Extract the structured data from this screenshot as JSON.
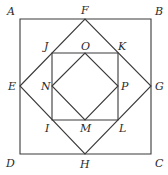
{
  "diagram": {
    "shapes": {
      "outer_square": [
        "A",
        "B",
        "C",
        "D"
      ],
      "outer_diamond": [
        "E",
        "F",
        "G",
        "H"
      ],
      "inner_square": [
        "J",
        "K",
        "L",
        "I"
      ],
      "inner_diamond": [
        "N",
        "O",
        "P",
        "M"
      ]
    },
    "points": {
      "A": {
        "x": 20,
        "y": 19
      },
      "B": {
        "x": 151,
        "y": 19
      },
      "C": {
        "x": 151,
        "y": 154
      },
      "D": {
        "x": 20,
        "y": 154
      },
      "E": {
        "x": 20,
        "y": 86
      },
      "F": {
        "x": 85,
        "y": 19
      },
      "G": {
        "x": 151,
        "y": 86
      },
      "H": {
        "x": 85,
        "y": 154
      },
      "J": {
        "x": 52,
        "y": 53
      },
      "K": {
        "x": 118,
        "y": 53
      },
      "L": {
        "x": 118,
        "y": 120
      },
      "I": {
        "x": 52,
        "y": 120
      },
      "O": {
        "x": 85,
        "y": 53
      },
      "P": {
        "x": 118,
        "y": 86
      },
      "M": {
        "x": 85,
        "y": 120
      },
      "N": {
        "x": 52,
        "y": 86
      }
    },
    "labels": {
      "A": "A",
      "B": "B",
      "C": "C",
      "D": "D",
      "E": "E",
      "F": "F",
      "G": "G",
      "H": "H",
      "I": "I",
      "J": "J",
      "K": "K",
      "L": "L",
      "M": "M",
      "N": "N",
      "O": "O",
      "P": "P"
    },
    "stroke_color": "#3a3a3a",
    "label_color": "#2a2a2a"
  }
}
